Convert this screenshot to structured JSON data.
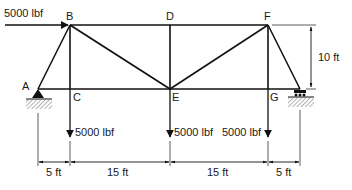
{
  "diagram": {
    "type": "truss",
    "nodes": [
      {
        "id": "A",
        "label": "A"
      },
      {
        "id": "B",
        "label": "B"
      },
      {
        "id": "C",
        "label": "C"
      },
      {
        "id": "D",
        "label": "D"
      },
      {
        "id": "E",
        "label": "E"
      },
      {
        "id": "F",
        "label": "F"
      },
      {
        "id": "G",
        "label": "G"
      }
    ],
    "members": [
      "AB",
      "AC",
      "BC",
      "BD",
      "BE",
      "CE",
      "DE",
      "DF",
      "EF",
      "EG",
      "FG",
      "F-support",
      "G-support"
    ],
    "loads": {
      "horizontal_B": "5000 lbf",
      "vertical_C": "5000 lbf",
      "vertical_E": "5000 lbf",
      "vertical_G": "5000 lbf"
    },
    "supports": {
      "left": "pin",
      "right": "roller"
    },
    "dimensions": {
      "height": "10 ft",
      "span_1": "5 ft",
      "span_2": "15 ft",
      "span_3": "15 ft",
      "span_4": "5 ft"
    }
  }
}
